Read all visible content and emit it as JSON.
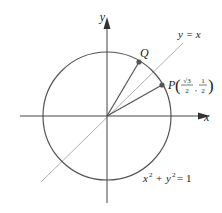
{
  "diagram": {
    "type": "unit-circle",
    "axes": {
      "x_label": "x",
      "y_label": "y"
    },
    "line_label": "y = x",
    "circle_equation": {
      "lhs_x": "x",
      "exp": "2",
      "plus": "+",
      "lhs_y": "y",
      "eq": "= 1",
      "full": "x² + y² = 1"
    },
    "points": [
      {
        "name": "Q",
        "label": "Q"
      },
      {
        "name": "P",
        "label": "P",
        "coords": {
          "x_num": "√3",
          "x_den": "2",
          "y_num": "1",
          "y_den": "2",
          "full": "(√3/2, 1/2)"
        }
      }
    ],
    "colors": {
      "circle": "#555555",
      "axes": "#444444",
      "line_y_eq_x": "#aaaaaa",
      "radii": "#555555",
      "points": "#555555",
      "background": "#ffffff"
    }
  }
}
